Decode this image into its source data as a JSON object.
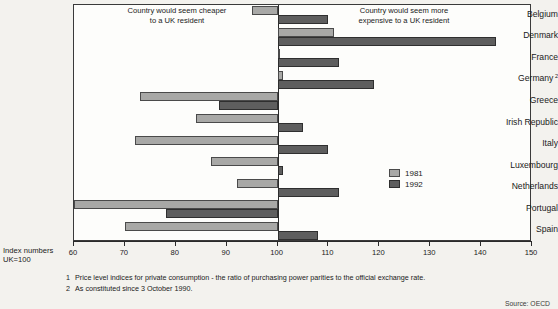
{
  "captions": {
    "cheaper": "Country would seem cheaper\nto a UK resident",
    "expensive": "Country would seem more\nexpensive to a UK resident"
  },
  "axis_note": "Index numbers\nUK=100",
  "legend": {
    "items": [
      {
        "label": "1981",
        "color": "#a8a8a6"
      },
      {
        "label": "1992",
        "color": "#5e5e5e"
      }
    ]
  },
  "footnotes": [
    {
      "num": "1",
      "text": "Price level indices for private consumption - the ratio of purchasing power parities to the official exchange rate."
    },
    {
      "num": "2",
      "text": "As constituted since 3 October 1990."
    }
  ],
  "source": "Source: OECD",
  "chart_data": {
    "type": "bar",
    "orientation": "horizontal",
    "title": "",
    "subtitle": "",
    "xlabel": "Index numbers UK=100",
    "ylabel": "",
    "xlim": [
      60,
      150
    ],
    "baseline": 100,
    "xticks": [
      60,
      70,
      80,
      90,
      100,
      110,
      120,
      130,
      140,
      150
    ],
    "grid": false,
    "legend_position": "right-inside",
    "categories": [
      "Belgium",
      "Denmark",
      "France",
      "Germany",
      "Greece",
      "Irish Republic",
      "Italy",
      "Luxembourg",
      "Netherlands",
      "Portugal",
      "Spain"
    ],
    "category_footnote_marks": {
      "Germany": "2"
    },
    "series": [
      {
        "name": "1981",
        "color": "#a8a8a6",
        "values": [
          95,
          111,
          100,
          101,
          73,
          84,
          72,
          87,
          92,
          60,
          70
        ]
      },
      {
        "name": "1992",
        "color": "#5e5e5e",
        "values": [
          110,
          143,
          112,
          119,
          88.5,
          105,
          110,
          101,
          112,
          78,
          108
        ]
      }
    ]
  }
}
